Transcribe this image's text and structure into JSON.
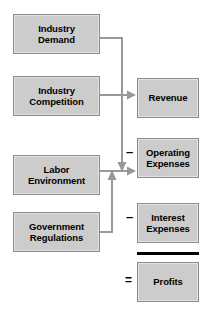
{
  "diagram": {
    "colors": {
      "box_fill": "#cccccc",
      "box_border": "#8c8c8c",
      "box_inner_highlight": "#e2e2e2",
      "connector": "#999999",
      "total_rule": "#000000",
      "text": "#000000",
      "background": "#ffffff"
    },
    "drivers": [
      {
        "id": "industry-demand",
        "label": "Industry\nDemand"
      },
      {
        "id": "industry-competition",
        "label": "Industry\nCompetition"
      },
      {
        "id": "labor-environment",
        "label": "Labor\nEnvironment"
      },
      {
        "id": "government-regulations",
        "label": "Government\nRegulations"
      }
    ],
    "outcomes": [
      {
        "id": "revenue",
        "label": "Revenue"
      },
      {
        "id": "operating-expenses",
        "label": "Operating\nExpenses"
      },
      {
        "id": "interest-expenses",
        "label": "Interest\nExpenses"
      },
      {
        "id": "profits",
        "label": "Profits"
      }
    ],
    "operators": [
      {
        "id": "minus-operating-expenses",
        "symbol": "–"
      },
      {
        "id": "minus-interest-expenses",
        "symbol": "–"
      },
      {
        "id": "equals-profits",
        "symbol": "="
      }
    ],
    "connections": [
      {
        "from": "industry-demand",
        "to": "operating-expenses",
        "arrow": "down"
      },
      {
        "from": "industry-competition",
        "to": "revenue",
        "arrow": "right"
      },
      {
        "from": "labor-environment",
        "to": "operating-expenses",
        "arrow": "right"
      },
      {
        "from": "government-regulations",
        "to": "operating-expenses",
        "arrow": "up"
      }
    ]
  }
}
